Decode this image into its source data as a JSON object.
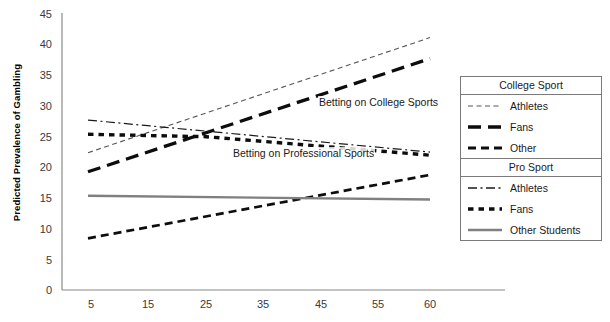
{
  "chart_data": {
    "type": "line",
    "title": "",
    "xlabel": "",
    "ylabel": "Predicted Prevalence of Gambling",
    "xlim": [
      0,
      65
    ],
    "ylim": [
      0,
      45
    ],
    "xticks": [
      "5",
      "15",
      "25",
      "35",
      "45",
      "55",
      "60"
    ],
    "xtick_values": [
      5,
      15,
      25,
      35,
      45,
      55,
      60
    ],
    "yticks": [
      "0",
      "5",
      "10",
      "15",
      "20",
      "25",
      "30",
      "35",
      "40",
      "45"
    ],
    "ytick_values": [
      0,
      5,
      10,
      15,
      20,
      25,
      30,
      35,
      40,
      45
    ],
    "grid": false,
    "legend_position": "right",
    "annotations": [
      {
        "text": "Betting on College Sports",
        "x": 40,
        "y": 29.5
      },
      {
        "text": "Betting on Professional Sports",
        "x": 31,
        "y": 21.0
      }
    ],
    "x": [
      5,
      60
    ],
    "series": [
      {
        "name": "Athletes",
        "group": "College Sport",
        "style": "thin-dashed",
        "color": "#555555",
        "width": 1.0,
        "values": [
          22.3,
          41.0
        ]
      },
      {
        "name": "Fans",
        "group": "College Sport",
        "style": "bold-dashed",
        "color": "#0d0d0d",
        "width": 3.2,
        "values": [
          19.2,
          37.6
        ]
      },
      {
        "name": "Other",
        "group": "College Sport",
        "style": "medium-dashed",
        "color": "#0d0d0d",
        "width": 2.6,
        "values": [
          8.4,
          18.7
        ]
      },
      {
        "name": "Athletes",
        "group": "Pro Sport",
        "style": "dash-dot",
        "color": "#1a1a1a",
        "width": 1.1,
        "values": [
          27.6,
          22.4
        ]
      },
      {
        "name": "Fans",
        "group": "Pro Sport",
        "style": "dotted-square",
        "color": "#0d0d0d",
        "width": 3.2,
        "values": [
          25.3,
          21.9
        ],
        "peak": {
          "x": 24,
          "y": 24.9
        }
      },
      {
        "name": "Other Students",
        "group": "Pro Sport",
        "style": "solid",
        "color": "#808080",
        "width": 2.4,
        "values": [
          15.3,
          14.7
        ]
      }
    ]
  },
  "legend": {
    "groups": [
      {
        "header": "College Sport",
        "rows": [
          {
            "label": "Athletes",
            "swatch": "thin-dashed"
          },
          {
            "label": "Fans",
            "swatch": "bold-dashed"
          },
          {
            "label": "Other",
            "swatch": "medium-dashed"
          }
        ]
      },
      {
        "header": "Pro Sport",
        "rows": [
          {
            "label": "Athletes",
            "swatch": "dash-dot"
          },
          {
            "label": "Fans",
            "swatch": "dotted-square"
          },
          {
            "label": "Other Students",
            "swatch": "solid"
          }
        ]
      }
    ]
  },
  "axis": {
    "y_title": "Predicted Prevalence of Gambling"
  }
}
